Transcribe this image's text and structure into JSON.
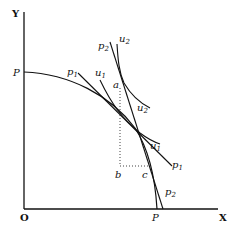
{
  "diagram": {
    "axes": {
      "x_label": "X",
      "y_label": "Y",
      "origin_label": "O"
    },
    "ppf": {
      "label_y_intercept": "P",
      "label_x_intercept": "P"
    },
    "price_lines": [
      {
        "label": "p",
        "sub": "1"
      },
      {
        "label": "p",
        "sub": "1"
      },
      {
        "label": "p",
        "sub": "2"
      },
      {
        "label": "p",
        "sub": "2"
      }
    ],
    "indifference_curves": [
      {
        "label": "u",
        "sub": "1"
      },
      {
        "label": "u",
        "sub": "1"
      },
      {
        "label": "u",
        "sub": "2"
      },
      {
        "label": "u",
        "sub": "2"
      }
    ],
    "points": {
      "a": "a",
      "b": "b",
      "c": "c"
    },
    "colors": {
      "ink": "#111111",
      "background": "#ffffff"
    }
  }
}
